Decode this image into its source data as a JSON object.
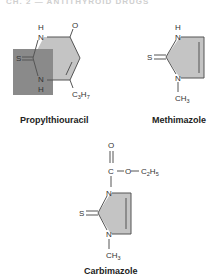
{
  "header": {
    "text": "CH. 2 — ANTITHYROID DRUGS"
  },
  "colors": {
    "ring_fill": "#c4c4c4",
    "highlight_fill": "#8a8a8a",
    "bond": "#555555",
    "text": "#333333"
  },
  "molecules": [
    {
      "name": "Propylthiouracil",
      "atoms": [
        "H",
        "N",
        "O",
        "S",
        "N",
        "H",
        "C3H7"
      ],
      "substituent": "C3H7"
    },
    {
      "name": "Methimazole",
      "atoms": [
        "H",
        "N",
        "S",
        "N",
        "CH3"
      ],
      "substituent": "CH3"
    },
    {
      "name": "Carbimazole",
      "atoms": [
        "O",
        "C",
        "O",
        "C2H5",
        "N",
        "S",
        "N",
        "CH3"
      ],
      "substituent": "C2H5",
      "n_substituent": "CH3"
    }
  ]
}
